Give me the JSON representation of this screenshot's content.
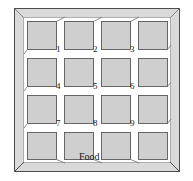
{
  "figure": {
    "name": "grid-maze-diagram",
    "colors": {
      "frame_fill": "#d9d9d9",
      "block_fill": "#cfcfcf",
      "corridor_fill": "#ffffff",
      "outline": "#4d4d4d",
      "block_outline": "#5a5a5a",
      "text": "#1a1a1a",
      "page_background": "#ffffff"
    },
    "outer_border": {
      "label": "maze-enclosure-wall",
      "x": 14,
      "y": 8,
      "width": 166,
      "height": 164
    },
    "grid": {
      "rows": 4,
      "cols": 4,
      "block_count": 16,
      "block_width": 30,
      "block_height": 29,
      "col_x": [
        27,
        64,
        101,
        138
      ],
      "row_y": [
        21,
        58,
        95,
        132
      ]
    },
    "intersection_labels": [
      {
        "id": "1",
        "text": "1",
        "x": 56,
        "y": 45
      },
      {
        "id": "2",
        "text": "2",
        "x": 93,
        "y": 45
      },
      {
        "id": "3",
        "text": "3",
        "x": 130,
        "y": 45
      },
      {
        "id": "4",
        "text": "4",
        "x": 56,
        "y": 82
      },
      {
        "id": "5",
        "text": "5",
        "x": 93,
        "y": 82
      },
      {
        "id": "6",
        "text": "6",
        "x": 130,
        "y": 82
      },
      {
        "id": "7",
        "text": "7",
        "x": 56,
        "y": 119
      },
      {
        "id": "8",
        "text": "8",
        "x": 93,
        "y": 119
      },
      {
        "id": "9",
        "text": "9",
        "x": 130,
        "y": 119
      }
    ],
    "annotations": [
      {
        "id": "food",
        "text": "Food",
        "x": 79,
        "y": 157
      }
    ]
  }
}
